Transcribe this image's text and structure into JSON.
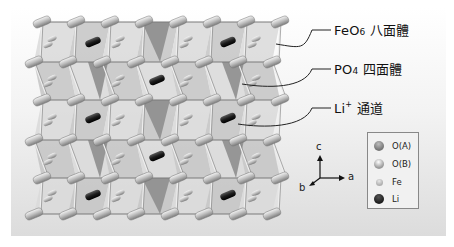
{
  "figure": {
    "background_top": "#ffffff",
    "background_bottom": "#dcdcdc"
  },
  "callouts": [
    {
      "id": "feo6",
      "formula": "FeO",
      "subscript": "6",
      "text": "八面體",
      "target": [
        276,
        44
      ],
      "label_pos": [
        334,
        22
      ]
    },
    {
      "id": "po4",
      "formula": "PO",
      "subscript": "4",
      "text": "四面體",
      "target": [
        242,
        84
      ],
      "label_pos": [
        334,
        61
      ]
    },
    {
      "id": "li",
      "formula": "Li",
      "superscript": "+",
      "text": "通道",
      "target": [
        238,
        124
      ],
      "label_pos": [
        334,
        100
      ]
    }
  ],
  "axes": {
    "c_label": "c",
    "a_label": "a",
    "b_label": "b"
  },
  "legend": {
    "items": [
      {
        "label": "O(A)",
        "color": "#777777",
        "highlight": "#bdbdbd"
      },
      {
        "label": "O(B)",
        "color": "#9a9a9a",
        "highlight": "#ffffff"
      },
      {
        "label": "Fe",
        "color": "#b0b0b0",
        "highlight": "#e8e8e8"
      },
      {
        "label": "Li",
        "color": "#1e1e1e",
        "highlight": "#555555"
      }
    ]
  },
  "colors": {
    "octahedron_light": "#d9d9d9",
    "octahedron_mid": "#c4c4c4",
    "tetrahedron_dark": "#8e8e8e",
    "edge": "#7a7a7a",
    "oxygen": "#a8a8a8",
    "lithium": "#1c1c1c",
    "callout_line": "#222222"
  },
  "structure": {
    "rows_y": [
      22,
      62,
      100,
      140,
      178,
      214
    ],
    "row_x_offsets": [
      0,
      -8,
      0,
      -8,
      0,
      -8
    ],
    "columns_x": [
      42,
      76,
      110,
      144,
      178,
      212,
      246,
      280
    ],
    "li_atoms": [
      [
        93,
        42
      ],
      [
        228,
        42
      ],
      [
        157,
        80
      ],
      [
        93,
        118
      ],
      [
        228,
        118
      ],
      [
        157,
        156
      ],
      [
        93,
        195
      ],
      [
        228,
        195
      ]
    ],
    "po4_tetrahedra": [
      [
        [
          142,
          22
        ],
        [
          170,
          22
        ],
        [
          160,
          62
        ]
      ],
      [
        [
          88,
          62
        ],
        [
          108,
          62
        ],
        [
          100,
          100
        ]
      ],
      [
        [
          222,
          62
        ],
        [
          244,
          62
        ],
        [
          236,
          100
        ]
      ],
      [
        [
          142,
          100
        ],
        [
          170,
          100
        ],
        [
          160,
          140
        ]
      ],
      [
        [
          88,
          140
        ],
        [
          108,
          140
        ],
        [
          100,
          178
        ]
      ],
      [
        [
          222,
          140
        ],
        [
          244,
          140
        ],
        [
          236,
          178
        ]
      ],
      [
        [
          142,
          178
        ],
        [
          170,
          178
        ],
        [
          160,
          214
        ]
      ]
    ]
  }
}
